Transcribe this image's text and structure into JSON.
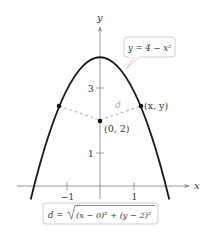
{
  "diagram": {
    "axes": {
      "x_label": "x",
      "y_label": "y",
      "x_ticks": [
        {
          "value": -1,
          "label": "−1"
        },
        {
          "value": 1,
          "label": "1"
        }
      ],
      "y_ticks": [
        {
          "value": 1,
          "label": "1"
        },
        {
          "value": 3,
          "label": "3"
        }
      ]
    },
    "curve": {
      "equation_label": "y = 4 − x²",
      "function": "4 - x^2",
      "color": "#1a1a1a"
    },
    "points": {
      "center": {
        "label": "(0, 2)",
        "x": 0,
        "y": 2
      },
      "moving": {
        "label": "(x, y)"
      },
      "distance_label": "d"
    },
    "formula_box": {
      "lhs": "d = ",
      "radicand": "(x − 0)² + (y − 2)²"
    },
    "colors": {
      "axis": "#8c8c8c",
      "dash": "#bdbdbd",
      "box_border": "#c8c8c8",
      "text": "#333333"
    }
  }
}
